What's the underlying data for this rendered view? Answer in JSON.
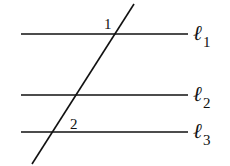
{
  "diagram": {
    "title": "",
    "colors": {
      "stroke": "#111111",
      "background": "#ffffff"
    },
    "parallel_lines": [
      {
        "name": "ℓ",
        "sub": "1",
        "y": 34
      },
      {
        "name": "ℓ",
        "sub": "2",
        "y": 95
      },
      {
        "name": "ℓ",
        "sub": "3",
        "y": 132
      }
    ],
    "transversal": {
      "x1": 134,
      "y1": 4,
      "x2": 32,
      "y2": 164
    },
    "angles": [
      {
        "label": "1",
        "x": 104,
        "y": 29
      },
      {
        "label": "2",
        "x": 70,
        "y": 129
      }
    ]
  }
}
